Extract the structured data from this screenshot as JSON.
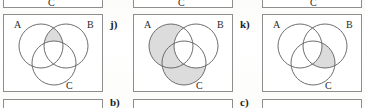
{
  "page": {
    "background_color": "#fdfdfc",
    "box_border_color": "#8e8e8e",
    "circle_stroke_color": "#5d5d5d",
    "shade_color": "#dcdcdc",
    "text_color": "#1c1c1c"
  },
  "top_row_fragments": [
    {
      "label_c": "C"
    },
    {
      "label_c": "C"
    },
    {
      "label_c": "C"
    }
  ],
  "middle_row": {
    "items": [
      {
        "item_label": "",
        "labels": {
          "a": "A",
          "b": "B",
          "c": "C"
        },
        "shaded_regions": [
          "A and B only"
        ]
      },
      {
        "item_label": "j)",
        "labels": {
          "a": "A",
          "b": "B",
          "c": "C"
        },
        "shaded_regions": [
          "A only",
          "A and C only",
          "C only"
        ]
      },
      {
        "item_label": "k)",
        "labels": {
          "a": "A",
          "b": "B",
          "c": "C"
        },
        "shaded_regions": [
          "B and C only"
        ]
      }
    ]
  },
  "bottom_row_fragments": [
    {
      "item_label": ""
    },
    {
      "item_label": "b)"
    },
    {
      "item_label": "c)"
    }
  ]
}
